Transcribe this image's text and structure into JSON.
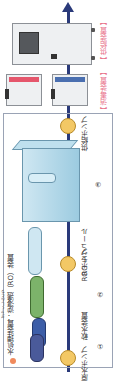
{
  "title": "水処理装置：逆浸透（RO）装置",
  "title_ruby": "ぎゃくしんとう",
  "top_labels": {
    "supply_device": "【 供給装置 】",
    "disinfection_device": "【 消毒装置 】"
  },
  "components": [
    {
      "id": "raw-water-pump",
      "label": "原水ポンプ"
    },
    {
      "id": "filter-1",
      "label": "①"
    },
    {
      "id": "water-softener",
      "label": "軟水装置"
    },
    {
      "id": "filter-2",
      "label": "②"
    },
    {
      "id": "ro-pump",
      "label": "RO ポンプ"
    },
    {
      "id": "ro-module",
      "label": "RO モジュール"
    },
    {
      "id": "tank-3",
      "label": "③"
    },
    {
      "id": "supply-pump",
      "label": "供給ポンプ"
    }
  ],
  "colors": {
    "flow_line": "#2a3a7a",
    "label_pink": "#e8728a",
    "pump": "#f3c865",
    "cyl_navy": "#4a5a9a",
    "cyl_blue": "#3d5ea8",
    "cyl_green": "#7cb36a",
    "cyl_light": "#cfe7f2"
  }
}
